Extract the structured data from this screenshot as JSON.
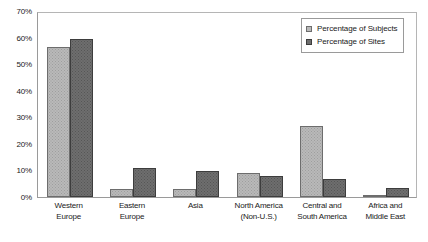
{
  "chart_data": {
    "type": "bar",
    "title": "",
    "xlabel": "",
    "ylabel": "",
    "ylim": [
      0,
      70
    ],
    "grid": false,
    "legend_position": "top-right",
    "ytick_labels": [
      "70%",
      "60%",
      "50%",
      "40%",
      "30%",
      "20%",
      "10%",
      "0%"
    ],
    "ytick_values": [
      70,
      60,
      50,
      40,
      30,
      20,
      10,
      0
    ],
    "categories": [
      "Western Europe",
      "Eastern Europe",
      "Asia",
      "North America (Non-U.S.)",
      "Central and South America",
      "Africa and Middle East"
    ],
    "category_lines": [
      [
        "Western",
        "Europe"
      ],
      [
        "Eastern",
        "Europe"
      ],
      [
        "Asia"
      ],
      [
        "North America",
        "(Non-U.S.)"
      ],
      [
        "Central and",
        "South America"
      ],
      [
        "Africa and",
        "Middle East"
      ]
    ],
    "series": [
      {
        "name": "Percentage of Subjects",
        "color": "#b9b9b9",
        "values": [
          57,
          3,
          3,
          9,
          27,
          0.5
        ]
      },
      {
        "name": "Percentage of Sites",
        "color": "#6e6e6e",
        "values": [
          60,
          11,
          10,
          8,
          7,
          3.5
        ]
      }
    ]
  },
  "legend": {
    "items": [
      {
        "label": "Percentage of Subjects"
      },
      {
        "label": "Percentage of Sites"
      }
    ]
  }
}
